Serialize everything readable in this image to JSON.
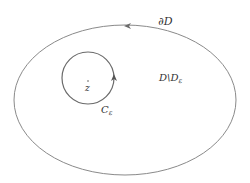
{
  "diagram": {
    "outer_boundary": {
      "label": "∂D",
      "shape": "ellipse",
      "cx": 125,
      "cy": 100,
      "rx": 111,
      "ry": 75,
      "orientation": "counterclockwise",
      "arrow_at": [
        127,
        26
      ]
    },
    "inner_circle": {
      "label": "C",
      "label_sub": "ε",
      "cx": 88,
      "cy": 78,
      "r": 26,
      "orientation": "counterclockwise",
      "arrow_at": [
        114,
        78
      ]
    },
    "center_point": {
      "label": "z",
      "x": 88,
      "y": 80
    },
    "region": {
      "label_main": "D\\D",
      "label_sub": "ε"
    },
    "colors": {
      "stroke": "#8a8a8a",
      "text": "#333333",
      "background": "#ffffff"
    }
  }
}
